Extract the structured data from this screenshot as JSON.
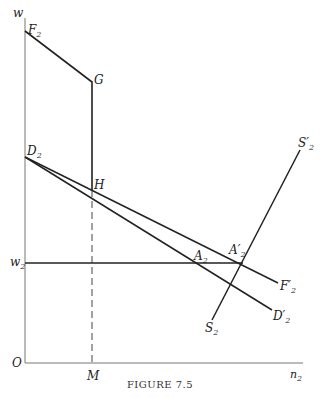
{
  "figure": {
    "caption": "FIGURE 7.5",
    "axes": {
      "y_label": "w",
      "x_label": "n",
      "x_label_sub": "2",
      "origin": "O"
    },
    "points": {
      "F2": {
        "main": "F",
        "sub": "2"
      },
      "G": {
        "main": "G"
      },
      "D2": {
        "main": "D",
        "sub": "2"
      },
      "H": {
        "main": "H"
      },
      "w2": {
        "main": "w",
        "sub": "2"
      },
      "M": {
        "main": "M"
      },
      "A2": {
        "main": "A",
        "sub": "2"
      },
      "A2p": {
        "main": "A′",
        "sub": "2"
      },
      "F2p": {
        "main": "F′",
        "sub": "2"
      },
      "D2p": {
        "main": "D′",
        "sub": "2"
      },
      "S2": {
        "main": "S",
        "sub": "2"
      },
      "S2p": {
        "main": "S′",
        "sub": "2"
      }
    },
    "line_color": "#222222"
  }
}
